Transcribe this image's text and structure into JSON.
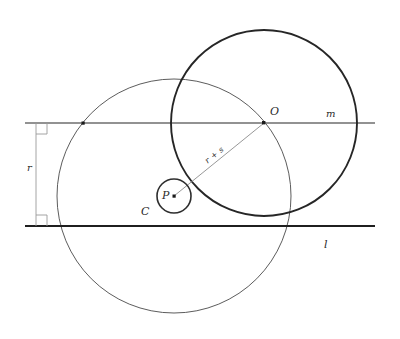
{
  "figure": {
    "type": "geometry-diagram",
    "canvas": {
      "width": 400,
      "height": 339,
      "background": "#ffffff"
    },
    "labels": {
      "center_O": "O",
      "line_m": "m",
      "line_l": "l",
      "distance_r": "r",
      "point_P": "P",
      "circle_C": "C",
      "radius_sum": "r + s"
    },
    "colors": {
      "ink": "#2b2b2b",
      "thin_stroke": "#4a4a4a",
      "bold_stroke": "#262626",
      "line_m_stroke": "#6e6e6e",
      "line_l_stroke": "#1f1f1f",
      "helper_stroke": "#9a9a9a"
    },
    "elements": {
      "line_m": {
        "y": 123,
        "x_start": 25,
        "x_end": 375,
        "label_x": 330,
        "label_y": 116
      },
      "line_l": {
        "y": 226,
        "x_start": 25,
        "x_end": 375,
        "label_x": 325,
        "label_y": 247
      },
      "vertical_segment": {
        "x": 36,
        "y_top": 123,
        "y_bottom": 226,
        "label_x": 30,
        "label_y": 170
      },
      "right_angle_top": {
        "x": 36,
        "y": 123,
        "size": 11
      },
      "right_angle_bottom": {
        "x": 36,
        "y": 226,
        "size": 11
      },
      "circle_big_bold": {
        "cx": 264,
        "cy": 123,
        "r": 93
      },
      "circle_big_thin": {
        "cx": 174,
        "cy": 196,
        "r": 117
      },
      "circle_small": {
        "cx": 174,
        "cy": 196,
        "r": 17
      },
      "point_O": {
        "x": 264,
        "y": 123,
        "label_x": 270,
        "label_y": 114
      },
      "point_P": {
        "x": 174,
        "y": 196,
        "label_x": 162,
        "label_y": 197
      },
      "label_C": {
        "x": 142,
        "y": 214
      },
      "segment_PO": {
        "x1": 174,
        "y1": 196,
        "x2": 264,
        "y2": 123
      },
      "label_rs": {
        "x": 216,
        "y": 155,
        "rotation": -39
      },
      "point_intersection_m_left": {
        "x": 83,
        "y": 123
      }
    }
  }
}
